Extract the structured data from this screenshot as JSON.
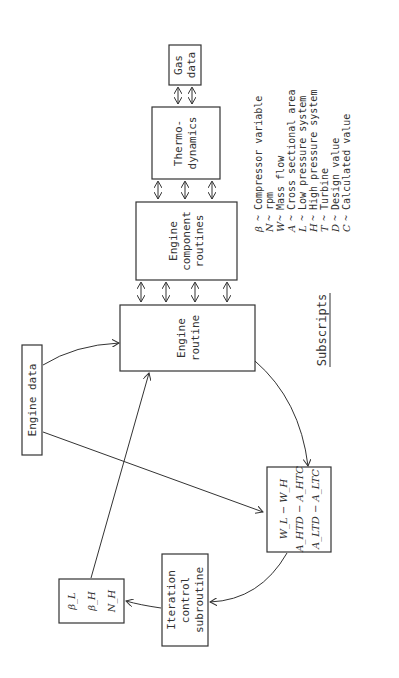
{
  "diagram": {
    "orientation": "rotated 90 degrees counterclockwise",
    "boxes": {
      "gas_data": {
        "lines": [
          "Gas",
          "data"
        ]
      },
      "thermodynamics": {
        "lines": [
          "Thermo-",
          "dynamics"
        ]
      },
      "engine_component_routines": {
        "lines": [
          "Engine",
          "component",
          "routines"
        ]
      },
      "engine_routine": {
        "lines": [
          "Engine",
          "routine"
        ]
      },
      "engine_data": {
        "lines": [
          "Engine data"
        ]
      },
      "iteration_control": {
        "lines": [
          "Iteration",
          "control",
          "subroutine"
        ]
      },
      "variables": {
        "lines": [
          "β_L",
          "β_H",
          "N_H"
        ]
      },
      "residuals": {
        "lines": [
          "W_L − W_H",
          "A_HTD − A_HTC",
          "A_LTD − A_LTC"
        ]
      }
    },
    "legend": {
      "title": "Subscripts",
      "items": [
        {
          "symbol": "β",
          "meaning": "Compressor variable"
        },
        {
          "symbol": "N",
          "meaning": "rpm"
        },
        {
          "symbol": "W",
          "meaning": "Mass flow"
        },
        {
          "symbol": "A",
          "meaning": "Cross sectional area"
        },
        {
          "symbol": "L",
          "meaning": "Low pressure system"
        },
        {
          "symbol": "H",
          "meaning": "High pressure system"
        },
        {
          "symbol": "T",
          "meaning": "Turbine"
        },
        {
          "symbol": "D",
          "meaning": "Design value"
        },
        {
          "symbol": "C",
          "meaning": "Calculated value"
        }
      ],
      "separator": "~"
    }
  }
}
